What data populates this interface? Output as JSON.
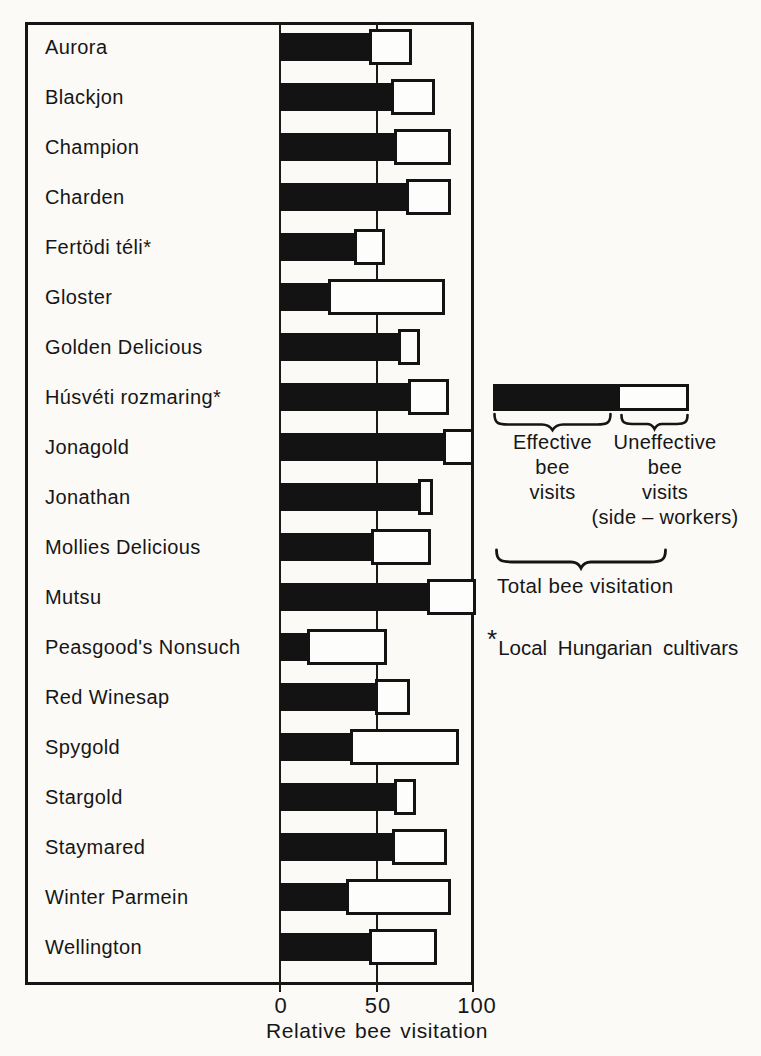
{
  "axis": {
    "xtick_labels": [
      "0",
      "50",
      "100"
    ],
    "xlabel": "Relative bee visitation"
  },
  "legend": {
    "effective_lines": [
      "Effective",
      "bee",
      "visits"
    ],
    "uneffective_lines": [
      "Uneffective",
      "bee",
      "visits",
      "(side – workers)"
    ],
    "total_label": "Total bee visitation",
    "footnote_star": "*",
    "footnote_text": "Local Hungarian cultivars",
    "colors": {
      "effective": "#131313",
      "uneffective": "#fdfdfb",
      "ink": "#151515",
      "paper": "#fbfaf7"
    }
  },
  "chart_data": {
    "type": "bar",
    "orientation": "horizontal",
    "stacked": true,
    "title": "",
    "xlabel": "Relative bee visitation",
    "ylabel": "",
    "xlim": [
      0,
      100
    ],
    "xticks": [
      0,
      50,
      100
    ],
    "grid": "vertical line at 50 only",
    "legend_position": "right",
    "categories": [
      "Aurora",
      "Blackjon",
      "Champion",
      "Charden",
      "Fertödi téli*",
      "Gloster",
      "Golden Delicious",
      "Húsvéti rozmaring*",
      "Jonagold",
      "Jonathan",
      "Mollies Delicious",
      "Mutsu",
      "Peasgood's Nonsuch",
      "Red Winesap",
      "Spygold",
      "Stargold",
      "Staymared",
      "Winter Parmein",
      "Wellington"
    ],
    "series": [
      {
        "name": "Effective bee visits",
        "color": "#131313",
        "values": [
          47,
          58,
          60,
          66,
          39,
          26,
          62,
          67,
          85,
          72,
          48,
          77,
          15,
          50,
          37,
          60,
          59,
          35,
          47
        ]
      },
      {
        "name": "Uneffective bee visits (side-workers)",
        "color": "#fdfdfb",
        "values": [
          20,
          21,
          27,
          21,
          14,
          58,
          9,
          19,
          14,
          6,
          29,
          23,
          39,
          16,
          54,
          9,
          26,
          52,
          33
        ]
      }
    ],
    "totals_note": "black + white segment = Total bee visitation",
    "totals": [
      67,
      79,
      87,
      87,
      53,
      84,
      71,
      86,
      99,
      78,
      77,
      100,
      54,
      66,
      91,
      69,
      85,
      87,
      80
    ],
    "footnote": "*Local Hungarian cultivars"
  }
}
